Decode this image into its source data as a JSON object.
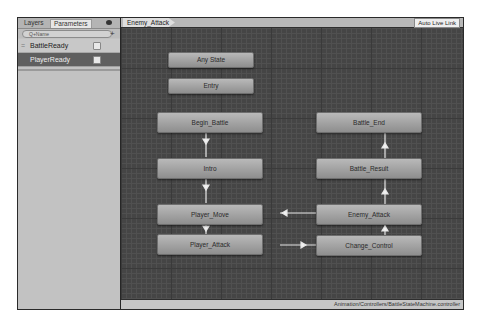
{
  "left_panel": {
    "tabs": [
      {
        "label": "Layers"
      },
      {
        "label": "Parameters"
      }
    ],
    "visibility_icon": "eye-icon",
    "search": {
      "placeholder": "Q+Name",
      "value": ""
    },
    "add_button": "+",
    "parameters": [
      {
        "name": "BattleReady",
        "type": "bool",
        "checked": false,
        "selected": false
      },
      {
        "name": "PlayerReady",
        "type": "bool",
        "checked": false,
        "selected": true
      }
    ]
  },
  "graph": {
    "breadcrumb": "Enemy_Attack",
    "auto_live_link": "Auto Live Link",
    "status_path": "Animation/Controllers/BattleStateMachine.controller",
    "states": [
      {
        "name": "Any State"
      },
      {
        "name": "Entry"
      },
      {
        "name": "Begin_Battle"
      },
      {
        "name": "Intro"
      },
      {
        "name": "Player_Move"
      },
      {
        "name": "Player_Attack"
      },
      {
        "name": "Battle_End"
      },
      {
        "name": "Battle_Result"
      },
      {
        "name": "Enemy_Attack"
      },
      {
        "name": "Change_Control"
      }
    ],
    "transitions": [
      {
        "from": "Begin_Battle",
        "to": "Intro"
      },
      {
        "from": "Intro",
        "to": "Player_Move"
      },
      {
        "from": "Player_Move",
        "to": "Player_Attack"
      },
      {
        "from": "Player_Attack",
        "to": "Change_Control"
      },
      {
        "from": "Change_Control",
        "to": "Enemy_Attack"
      },
      {
        "from": "Enemy_Attack",
        "to": "Player_Move"
      },
      {
        "from": "Enemy_Attack",
        "to": "Battle_Result"
      },
      {
        "from": "Battle_Result",
        "to": "Battle_End"
      }
    ],
    "colors": {
      "background": "#454545",
      "node": "#a5a5a5",
      "link": "#e8e8e8"
    }
  }
}
